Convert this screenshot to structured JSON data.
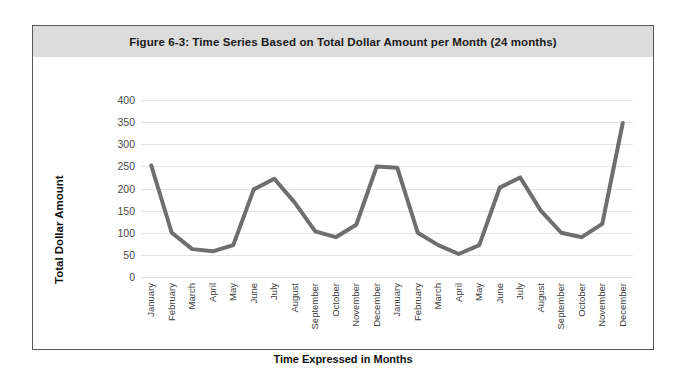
{
  "figure": {
    "title": "Figure 6-3: Time Series Based on Total Dollar Amount per Month (24 months)"
  },
  "chart_data": {
    "type": "line",
    "title": "Figure 6-3: Time Series Based on Total Dollar Amount per Month (24 months)",
    "xlabel": "Time Expressed in Months",
    "ylabel": "Total Dollar Amount",
    "ylim": [
      0,
      400
    ],
    "yticks": [
      0,
      50,
      100,
      150,
      200,
      250,
      300,
      350,
      400
    ],
    "grid": "horizontal",
    "legend": "none",
    "line_color": "#6e6e6e",
    "line_width": 4,
    "categories": [
      "January",
      "February",
      "March",
      "April",
      "May",
      "June",
      "July",
      "August",
      "September",
      "October",
      "November",
      "December",
      "January",
      "February",
      "March",
      "April",
      "May",
      "June",
      "July",
      "August",
      "September",
      "October",
      "November",
      "December"
    ],
    "values": [
      252,
      100,
      63,
      58,
      72,
      198,
      222,
      168,
      103,
      90,
      118,
      250,
      247,
      100,
      72,
      52,
      72,
      202,
      225,
      150,
      100,
      90,
      120,
      348
    ],
    "series": [
      {
        "name": "Total Dollar Amount",
        "values": [
          252,
          100,
          63,
          58,
          72,
          198,
          222,
          168,
          103,
          90,
          118,
          250,
          247,
          100,
          72,
          52,
          72,
          202,
          225,
          150,
          100,
          90,
          120,
          348
        ]
      }
    ]
  }
}
